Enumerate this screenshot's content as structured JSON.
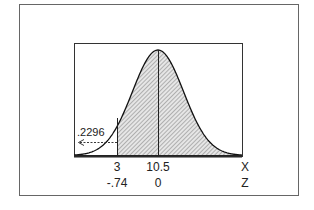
{
  "chart_data": {
    "type": "area",
    "title": "",
    "xlabel": "X",
    "zlabel": "Z",
    "x_ticks": [
      {
        "x": "3",
        "z": "-.74"
      },
      {
        "x": "10.5",
        "z": "0"
      }
    ],
    "mean_x": 10.5,
    "cutoff_x": 3,
    "cutoff_z": -0.74,
    "left_tail_area": ".2296",
    "shaded_region": "x >= 3",
    "grid": false,
    "legend": "none"
  },
  "labels": {
    "tick_x_cutoff": "3",
    "tick_x_mean": "10.5",
    "axis_x": "X",
    "tick_z_cutoff": "-.74",
    "tick_z_mean": "0",
    "axis_z": "Z",
    "tail_area": ".2296"
  },
  "colors": {
    "frame": "#555555",
    "curve": "#111111",
    "shade": "#bdbdbd",
    "background": "#ffffff"
  }
}
